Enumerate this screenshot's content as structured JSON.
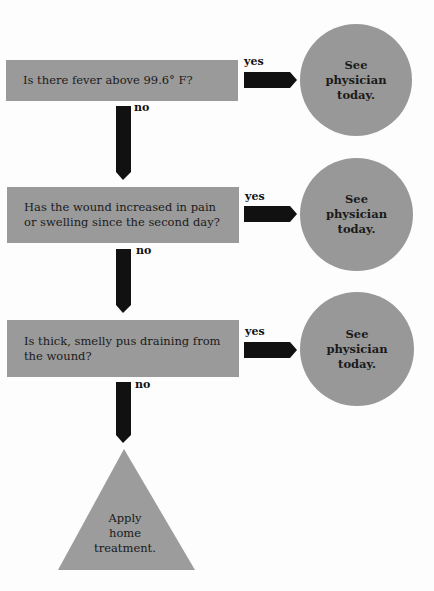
{
  "flowchart": {
    "questions": [
      {
        "text": "Is there fever above 99.6° F?",
        "yes_label": "yes",
        "no_label": "no",
        "outcome": "See\nphysician\ntoday."
      },
      {
        "text": "Has the wound increased in pain or swelling since the second day?",
        "yes_label": "yes",
        "no_label": "no",
        "outcome": "See\nphysician\ntoday."
      },
      {
        "text": "Is thick, smelly pus draining from the wound?",
        "yes_label": "yes",
        "no_label": "no",
        "outcome": "See\nphysician\ntoday."
      }
    ],
    "final": "Apply\nhome\ntreatment.",
    "colors": {
      "shape_fill": "#9a9a9a",
      "arrow_fill": "#111111"
    }
  }
}
